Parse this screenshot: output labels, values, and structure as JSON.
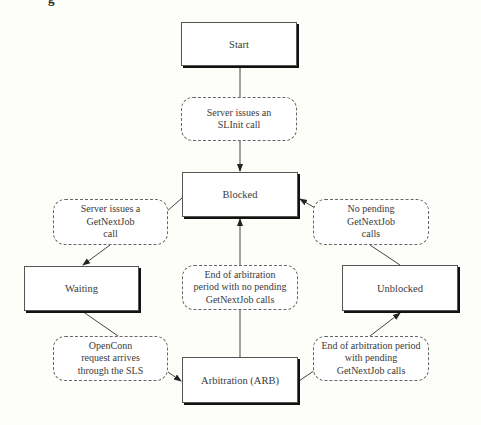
{
  "caption_fragment": "g",
  "states": {
    "start": "Start",
    "blocked": "Blocked",
    "waiting": "Waiting",
    "unblocked": "Unblocked",
    "arbitration": "Arbitration (ARB)"
  },
  "events": {
    "slinit": [
      "Server issues an",
      "SLInit call"
    ],
    "get_next_job": [
      "Server issues a",
      "GetNextJob",
      "call"
    ],
    "no_pending": [
      "No pending",
      "GetNextJob",
      "calls"
    ],
    "end_arb_no_pending": [
      "End of arbitration",
      "period with no pending",
      "GetNextJob calls"
    ],
    "open_conn": [
      "OpenConn",
      "request arrives",
      "through the SLS"
    ],
    "end_arb_pending": [
      "End of arbitration period",
      "with pending",
      "GetNextJob calls"
    ]
  },
  "transitions": [
    {
      "from": "Start",
      "event": "Server issues an SLInit call",
      "to": "Blocked"
    },
    {
      "from": "Blocked",
      "event": "Server issues a GetNextJob call",
      "to": "Waiting"
    },
    {
      "from": "Waiting",
      "event": "OpenConn request arrives through the SLS",
      "to": "Arbitration (ARB)"
    },
    {
      "from": "Arbitration (ARB)",
      "event": "End of arbitration period with no pending GetNextJob calls",
      "to": "Blocked"
    },
    {
      "from": "Arbitration (ARB)",
      "event": "End of arbitration period with pending GetNextJob calls",
      "to": "Unblocked"
    },
    {
      "from": "Unblocked",
      "event": "No pending GetNextJob calls",
      "to": "Blocked"
    }
  ]
}
